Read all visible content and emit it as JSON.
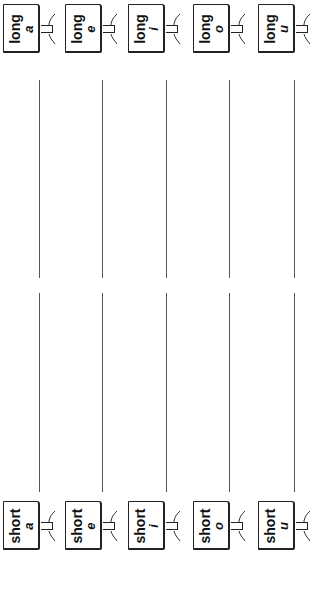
{
  "worksheet": {
    "orientation": "rotated-90-ccw",
    "long_signs": [
      {
        "word": "long",
        "vowel": "a"
      },
      {
        "word": "long",
        "vowel": "e"
      },
      {
        "word": "long",
        "vowel": "i"
      },
      {
        "word": "long",
        "vowel": "o"
      },
      {
        "word": "long",
        "vowel": "u"
      }
    ],
    "short_signs": [
      {
        "word": "short",
        "vowel": "a"
      },
      {
        "word": "short",
        "vowel": "e"
      },
      {
        "word": "short",
        "vowel": "i"
      },
      {
        "word": "short",
        "vowel": "o"
      },
      {
        "word": "short",
        "vowel": "u"
      }
    ],
    "writing_lines_per_row": 2,
    "rows": 5
  }
}
